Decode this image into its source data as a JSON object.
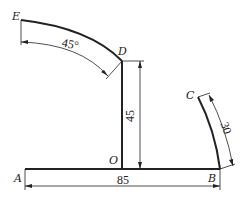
{
  "points": {
    "A": "A",
    "B": "B",
    "C": "C",
    "D": "D",
    "E": "E",
    "O": "O"
  },
  "dimensions": {
    "ab_length": "85",
    "od_height": "45",
    "de_angle": "45°",
    "bc_arc": "30"
  },
  "colors": {
    "line": "#222222",
    "background": "#ffffff"
  }
}
